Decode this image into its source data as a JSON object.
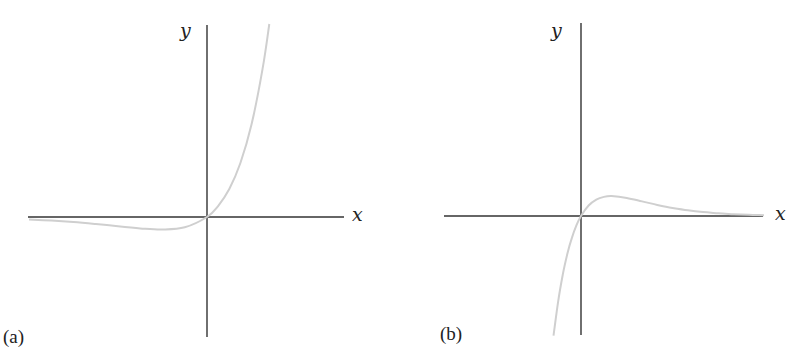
{
  "chart_data": [
    {
      "type": "line",
      "panel_label": "(a)",
      "title": "",
      "xlabel": "x",
      "ylabel": "y",
      "grid": false,
      "legend": null,
      "description": "Curve of the form y = x·e^x: slightly negative for x<0 with a shallow minimum, passes through origin, grows rapidly for x>0",
      "x": [
        -4.0,
        -3.5,
        -3.0,
        -2.5,
        -2.0,
        -1.5,
        -1.0,
        -0.5,
        0.0,
        0.25,
        0.5,
        0.75,
        1.0,
        1.25,
        1.4
      ],
      "y": [
        -0.073,
        -0.106,
        -0.149,
        -0.205,
        -0.271,
        -0.335,
        -0.368,
        -0.303,
        0.0,
        0.321,
        0.824,
        1.588,
        2.718,
        4.363,
        5.677
      ],
      "xlim": [
        -4.0,
        3.0
      ],
      "ylim": [
        -2.6,
        4.2
      ],
      "axes_color": "#333333",
      "curve_color": "#cfcfcf"
    },
    {
      "type": "line",
      "panel_label": "(b)",
      "title": "",
      "xlabel": "x",
      "ylabel": "y",
      "grid": false,
      "legend": null,
      "description": "Curve of the form y = x·e^(-x): steeply negative for x<0, passes through origin, rises to a maximum near x=1, then decays toward zero",
      "x": [
        -0.9,
        -0.75,
        -0.6,
        -0.45,
        -0.3,
        -0.15,
        0.0,
        0.25,
        0.5,
        0.75,
        1.0,
        1.5,
        2.0,
        2.5,
        3.0,
        3.5,
        4.0,
        4.5,
        5.0,
        5.5,
        6.0
      ],
      "y": [
        -2.214,
        -1.588,
        -1.093,
        -0.705,
        -0.405,
        -0.174,
        0.0,
        0.195,
        0.303,
        0.354,
        0.368,
        0.335,
        0.271,
        0.205,
        0.149,
        0.106,
        0.073,
        0.05,
        0.034,
        0.022,
        0.015
      ],
      "xlim": [
        -1.8,
        6.2
      ],
      "ylim": [
        -2.6,
        4.2
      ],
      "axes_color": "#333333",
      "curve_color": "#cfcfcf"
    }
  ],
  "panels": {
    "a": {
      "label": "(a)",
      "x_axis_label": "x",
      "y_axis_label": "y"
    },
    "b": {
      "label": "(b)",
      "x_axis_label": "x",
      "y_axis_label": "y"
    }
  }
}
